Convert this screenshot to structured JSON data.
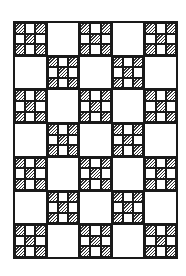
{
  "image": {
    "description": "Black-and-white line drawing of a nine-patch quilt pattern",
    "colors": {
      "line": "#1a1a1a",
      "background": "#ffffff",
      "hatch": "#333333"
    }
  },
  "quilt": {
    "rows": 7,
    "columns": 5,
    "layout": "checkerboard",
    "block_types": [
      "nine-patch",
      "plain"
    ],
    "nine_patch_hatched_cells": [
      0,
      2,
      4,
      6,
      8
    ],
    "grid": [
      [
        "nine-patch",
        "plain",
        "nine-patch",
        "plain",
        "nine-patch"
      ],
      [
        "plain",
        "nine-patch",
        "plain",
        "nine-patch",
        "plain"
      ],
      [
        "nine-patch",
        "plain",
        "nine-patch",
        "plain",
        "nine-patch"
      ],
      [
        "plain",
        "nine-patch",
        "plain",
        "nine-patch",
        "plain"
      ],
      [
        "nine-patch",
        "plain",
        "nine-patch",
        "plain",
        "nine-patch"
      ],
      [
        "plain",
        "nine-patch",
        "plain",
        "nine-patch",
        "plain"
      ],
      [
        "nine-patch",
        "plain",
        "nine-patch",
        "plain",
        "nine-patch"
      ]
    ]
  }
}
